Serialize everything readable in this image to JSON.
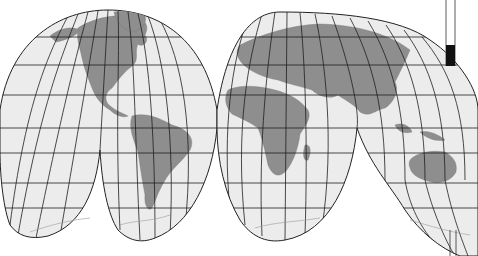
{
  "map": {
    "projection": "interrupted-homolosine",
    "style": "grayscale",
    "colors": {
      "ocean": "#ececec",
      "land": "#8e8e8e",
      "graticule": "#1e1e1e",
      "background": "#ffffff"
    },
    "lobes": [
      {
        "name": "north-america"
      },
      {
        "name": "eurasia"
      },
      {
        "name": "south-pacific-left"
      },
      {
        "name": "south-america"
      },
      {
        "name": "africa"
      },
      {
        "name": "australia"
      }
    ],
    "regions": [
      "North America",
      "South America",
      "Europe",
      "Asia",
      "Africa",
      "Australia",
      "Antarctica",
      "Greenland"
    ]
  }
}
